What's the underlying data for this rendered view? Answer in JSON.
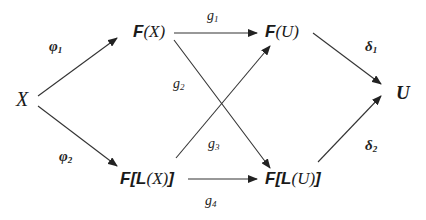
{
  "diagram": {
    "type": "commutative-diagram",
    "nodes": {
      "x": {
        "label": "X"
      },
      "fx": {
        "func": "F",
        "open": "(",
        "arg": "X",
        "close": ")"
      },
      "fu": {
        "func": "F",
        "open": "(",
        "arg": "U",
        "close": ")"
      },
      "u": {
        "label": "U"
      },
      "flx": {
        "func": "F",
        "open_bracket": "[",
        "inner_func": "L",
        "open": "(",
        "arg": "X",
        "close": ")",
        "close_bracket": "]"
      },
      "flu": {
        "func": "F",
        "open_bracket": "[",
        "inner_func": "L",
        "open": "(",
        "arg": "U",
        "close": ")",
        "close_bracket": "]"
      }
    },
    "edges": [
      {
        "id": "phi1",
        "from": "X",
        "to": "F(X)",
        "symbol": "φ",
        "index": "1"
      },
      {
        "id": "phi2",
        "from": "X",
        "to": "F[L(X)]",
        "symbol": "φ",
        "index": "2"
      },
      {
        "id": "g1",
        "from": "F(X)",
        "to": "F(U)",
        "symbol": "g",
        "index": "1"
      },
      {
        "id": "g2",
        "from": "F(X)",
        "to": "F[L(U)]",
        "symbol": "g",
        "index": "2"
      },
      {
        "id": "g3",
        "from": "F[L(X)]",
        "to": "F(U)",
        "symbol": "g",
        "index": "3"
      },
      {
        "id": "g4",
        "from": "F[L(X)]",
        "to": "F[L(U)]",
        "symbol": "g",
        "index": "4"
      },
      {
        "id": "delta1",
        "from": "F(U)",
        "to": "U",
        "symbol": "δ",
        "index": "1"
      },
      {
        "id": "delta2",
        "from": "F[L(U)]",
        "to": "U",
        "symbol": "δ",
        "index": "2"
      }
    ],
    "colors": {
      "line": "#333333",
      "text": "#1a1a1a"
    }
  }
}
